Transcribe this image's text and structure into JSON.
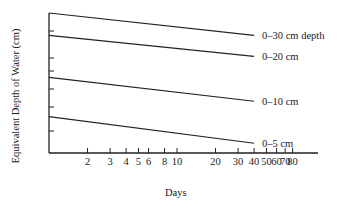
{
  "chart_data": {
    "type": "line",
    "title": "",
    "xlabel": "Days",
    "ylabel": "Equivalent Depth of Water (cm)",
    "x_scale": "log",
    "x_ticks": [
      2,
      3,
      4,
      5,
      6,
      8,
      10,
      20,
      30,
      40,
      50,
      60,
      70,
      80
    ],
    "x_tick_labels": [
      "2",
      "3",
      "4",
      "5",
      "6",
      "8",
      "10",
      "20",
      "30",
      "40",
      "50",
      "60",
      "70",
      "80"
    ],
    "xlim": [
      1,
      90
    ],
    "y_ticks_unlabeled": 6,
    "grid": false,
    "legend": "inline labels at right end of each line",
    "series": [
      {
        "name": "0–30 cm depth",
        "x": [
          1,
          40
        ],
        "y_rel": [
          1.0,
          0.84
        ]
      },
      {
        "name": "0–20 cm",
        "x": [
          1,
          40
        ],
        "y_rel": [
          0.84,
          0.69
        ]
      },
      {
        "name": "0–10 cm",
        "x": [
          1,
          40
        ],
        "y_rel": [
          0.54,
          0.37
        ]
      },
      {
        "name": "0–5 cm",
        "x": [
          1,
          40
        ],
        "y_rel": [
          0.26,
          0.07
        ]
      }
    ]
  },
  "labels": {
    "ylabel": "Equivalent Depth of Water (cm)",
    "xlabel": "Days"
  }
}
